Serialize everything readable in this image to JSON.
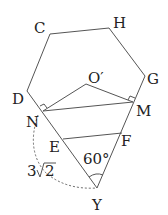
{
  "figure": {
    "type": "geometry-diagram",
    "points": {
      "C": {
        "label": "C",
        "x": 50,
        "y": 34
      },
      "H": {
        "label": "H",
        "x": 109,
        "y": 28
      },
      "G": {
        "label": "G",
        "x": 145,
        "y": 76
      },
      "D": {
        "label": "D",
        "x": 27,
        "y": 91
      },
      "N": {
        "label": "N",
        "x": 43,
        "y": 111
      },
      "M": {
        "label": "M",
        "x": 133,
        "y": 102
      },
      "O": {
        "label": "O′",
        "x": 86,
        "y": 84
      },
      "E": {
        "label": "E",
        "x": 63,
        "y": 139
      },
      "F": {
        "label": "F",
        "x": 122,
        "y": 133
      },
      "Y": {
        "label": "Y",
        "x": 97,
        "y": 188
      }
    },
    "annotations": {
      "angle": "60°",
      "arc_length": "3√2",
      "sqrt_coeff": "3",
      "sqrt_radicand": "2"
    }
  }
}
